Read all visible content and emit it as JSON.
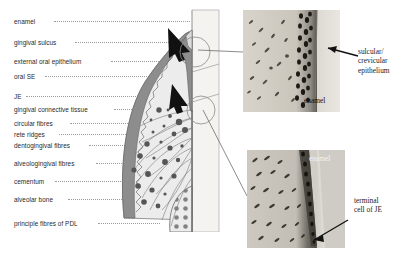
{
  "figure": {
    "type": "anatomical-diagram"
  },
  "diagram_labels": [
    {
      "id": "enamel",
      "text": "enamel",
      "x": 14,
      "y": 18,
      "leader_x": 54,
      "leader_w": 136,
      "leader_y": 21
    },
    {
      "id": "gingival-sulcus",
      "text": "gingival sulcus",
      "x": 14,
      "y": 39,
      "leader_x": 75,
      "leader_w": 112,
      "leader_y": 42
    },
    {
      "id": "external-oral-epithelium",
      "text": "external oral epithelium",
      "x": 14,
      "y": 58,
      "leader_x": 111,
      "leader_w": 62,
      "leader_y": 61
    },
    {
      "id": "oral-se",
      "text": "oral SE",
      "x": 14,
      "y": 73,
      "leader_x": 45,
      "leader_w": 120,
      "leader_y": 76
    },
    {
      "id": "je",
      "text": "JE",
      "x": 14,
      "y": 93,
      "leader_x": 26,
      "leader_w": 140,
      "leader_y": 96
    },
    {
      "id": "gingival-connective",
      "text": "gingival connective tissue",
      "x": 14,
      "y": 106,
      "leader_x": 114,
      "leader_w": 50,
      "leader_y": 109
    },
    {
      "id": "circular-fibres",
      "text": "circular fibres",
      "x": 14,
      "y": 120,
      "leader_x": 70,
      "leader_w": 84,
      "leader_y": 123
    },
    {
      "id": "rete-ridges",
      "text": "rete ridges",
      "x": 14,
      "y": 131,
      "leader_x": 59,
      "leader_w": 85,
      "leader_y": 134
    },
    {
      "id": "dentogingival-fibres",
      "text": "dentogingival fibres",
      "x": 14,
      "y": 142,
      "leader_x": 89,
      "leader_w": 56,
      "leader_y": 145
    },
    {
      "id": "alveologingival-fibres",
      "text": "alveologingival fibres",
      "x": 14,
      "y": 160,
      "leader_x": 96,
      "leader_w": 52,
      "leader_y": 163
    },
    {
      "id": "cementum",
      "text": "cementum",
      "x": 14,
      "y": 178,
      "leader_x": 55,
      "leader_w": 96,
      "leader_y": 181
    },
    {
      "id": "alveolar-bone",
      "text": "alveolar bone",
      "x": 14,
      "y": 196,
      "leader_x": 68,
      "leader_w": 88,
      "leader_y": 199
    },
    {
      "id": "principle-fibres-pdl",
      "text": "principle fibres of PDL",
      "x": 14,
      "y": 220,
      "leader_x": 98,
      "leader_w": 62,
      "leader_y": 223
    }
  ],
  "panels": {
    "top_right": {
      "name": "sulcular-crevicular-epithelium-micrograph",
      "callout_label": "sulcular/\ncrevicular\nepithelium",
      "in_image_label": "enamel"
    },
    "bottom_right": {
      "name": "terminal-cell-of-je-micrograph",
      "callout_label": "terminal\ncell of JE",
      "in_image_label": "enamel"
    }
  },
  "colors": {
    "epithelium_dark": "#8a8a8a",
    "connective_light": "#e9e9e9",
    "enamel_band": "#f2f2f0",
    "leader_line": "#8c8c8c",
    "text": "#2a2a2a",
    "arrow": "#111111"
  }
}
